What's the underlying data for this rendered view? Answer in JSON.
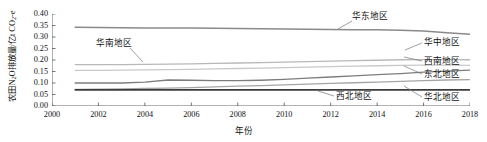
{
  "chart_data": {
    "type": "line",
    "title": "",
    "xlabel": "年份",
    "ylabel": "农田N2O排放量/亿t CO2-e",
    "ylabel_parts": {
      "pre": "农田N",
      "sub1": "2",
      "mid": "O排放量/亿t CO",
      "sub2": "2",
      "post": "-e"
    },
    "xlim": [
      2000,
      2018
    ],
    "ylim": [
      0.0,
      0.4
    ],
    "xticks": [
      2000,
      2002,
      2004,
      2006,
      2008,
      2010,
      2012,
      2014,
      2016,
      2018
    ],
    "yticks": [
      "0.00",
      "0.05",
      "0.10",
      "0.15",
      "0.20",
      "0.25",
      "0.30",
      "0.35",
      "0.40"
    ],
    "grid": false,
    "legend_position": "inline-annotations",
    "x": [
      2001,
      2002,
      2003,
      2004,
      2005,
      2006,
      2007,
      2008,
      2009,
      2010,
      2011,
      2012,
      2013,
      2014,
      2015,
      2016,
      2017,
      2018
    ],
    "series": [
      {
        "name": "华东地区",
        "color": "#8a8a8a",
        "width": 1.5,
        "values": [
          0.342,
          0.341,
          0.34,
          0.339,
          0.339,
          0.339,
          0.338,
          0.337,
          0.336,
          0.335,
          0.334,
          0.333,
          0.332,
          0.331,
          0.329,
          0.326,
          0.319,
          0.312
        ]
      },
      {
        "name": "华中地区",
        "color": "#b8b8b8",
        "width": 1.3,
        "values": [
          0.18,
          0.18,
          0.18,
          0.181,
          0.182,
          0.183,
          0.185,
          0.187,
          0.189,
          0.191,
          0.193,
          0.195,
          0.197,
          0.199,
          0.201,
          0.202,
          0.202,
          0.201
        ]
      },
      {
        "name": "西南地区",
        "color": "#c9c9c9",
        "width": 1.3,
        "values": [
          0.155,
          0.155,
          0.156,
          0.157,
          0.158,
          0.159,
          0.161,
          0.163,
          0.165,
          0.167,
          0.169,
          0.171,
          0.173,
          0.175,
          0.177,
          0.178,
          0.178,
          0.177
        ]
      },
      {
        "name": "东北地区",
        "color": "#7d7d7d",
        "width": 1.3,
        "values": [
          0.1,
          0.1,
          0.1,
          0.104,
          0.113,
          0.112,
          0.11,
          0.11,
          0.112,
          0.116,
          0.121,
          0.126,
          0.131,
          0.136,
          0.141,
          0.147,
          0.152,
          0.156
        ]
      },
      {
        "name": "华北地区",
        "color": "#a5a5a5",
        "width": 1.3,
        "values": [
          0.072,
          0.073,
          0.074,
          0.076,
          0.078,
          0.08,
          0.083,
          0.086,
          0.089,
          0.092,
          0.095,
          0.098,
          0.101,
          0.104,
          0.107,
          0.11,
          0.113,
          0.115
        ]
      },
      {
        "name": "西北地区",
        "color": "#3d3d3d",
        "width": 1.6,
        "values": [
          0.07,
          0.07,
          0.07,
          0.07,
          0.07,
          0.07,
          0.07,
          0.07,
          0.07,
          0.07,
          0.07,
          0.07,
          0.07,
          0.07,
          0.07,
          0.07,
          0.07,
          0.07
        ]
      }
    ],
    "annotations": [
      {
        "text": "华东地区",
        "left": 352,
        "top": 12,
        "leader": [
          [
            352,
            21
          ],
          [
            338,
            29
          ]
        ]
      },
      {
        "text": "华南地区",
        "left": 96,
        "top": 39,
        "leader": [
          [
            130,
            48
          ],
          [
            143,
            62
          ]
        ]
      },
      {
        "text": "华中地区",
        "left": 424,
        "top": 38,
        "leader": [
          [
            422,
            43
          ],
          [
            405,
            50
          ]
        ]
      },
      {
        "text": "西南地区",
        "left": 424,
        "top": 57,
        "leader": [
          [
            422,
            61
          ],
          [
            404,
            57
          ]
        ]
      },
      {
        "text": "东北地区",
        "left": 424,
        "top": 70,
        "leader": [
          [
            422,
            74
          ],
          [
            404,
            66
          ]
        ]
      },
      {
        "text": "西北地区",
        "left": 336,
        "top": 92,
        "leader": [
          [
            334,
            96
          ],
          [
            318,
            91
          ]
        ]
      },
      {
        "text": "华北地区",
        "left": 424,
        "top": 93,
        "leader": [
          [
            422,
            97
          ],
          [
            404,
            86
          ]
        ]
      }
    ]
  }
}
